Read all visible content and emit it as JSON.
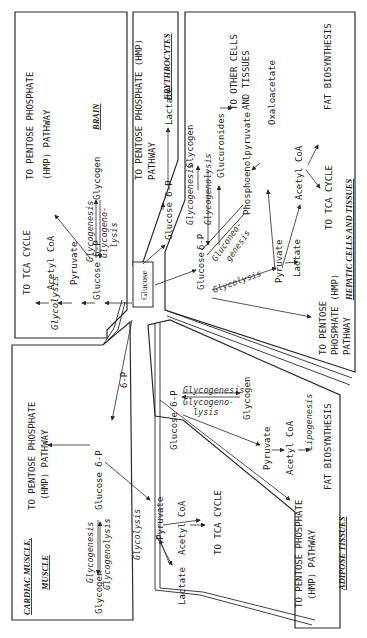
{
  "center": {
    "label": "Glucose"
  },
  "brain": {
    "title": "BRAIN",
    "glucose6p": "Glucose 6-P",
    "pyruvate": "Pyruvate",
    "acetylcoa": "Acetyl CoA",
    "tca": "TO TCA CYCLE",
    "glycolysis": "Glycolysis",
    "pentose_1": "TO PENTOSE PHOSPHATE",
    "pentose_2": "(HMP) PATHWAY",
    "glycogenesis": "Glycogenesis",
    "glycogen": "Glycogen",
    "glycogenolysis_1": "Glycogeno-",
    "glycogenolysis_2": "lysis"
  },
  "erythrocytes": {
    "title": "ERYTHROCYTES",
    "pentose_1": "TO PENTOSE PHOSPHATE (HMP)",
    "pentose_2": "PATHWAY",
    "glucose6p": "Glucose 6-P",
    "lactate": "Lactate"
  },
  "hepatic": {
    "title": "HEPATIC CELLS AND TISSUES",
    "glucose": "Glucose",
    "glucose6p": "6-P",
    "glycogenesis": "Glycogenesis",
    "glycogenolysis": "Glycogenolysis",
    "glycogen": "Glycogen",
    "glucuronides": "Glucuronides",
    "other_cells_1": "TO OTHER CELLS",
    "other_cells_2": "AND TISSUES",
    "gluconeo_1": "Gluconeo-",
    "gluconeo_2": "genesis",
    "pep": "Phosphoenolpyruvate",
    "oxaloacetate": "Oxaloacetate",
    "glycolysis": "Glycolysis",
    "pyruvate": "Pyruvate",
    "lactate": "Lactate",
    "acetylcoa": "Acetyl CoA",
    "fat": "FAT BIOSYNTHESIS",
    "tca": "TO TCA CYCLE",
    "pentose_1": "TO PENTOSE",
    "pentose_2": "PHOSPHATE (HMP)",
    "pentose_3": "PATHWAY"
  },
  "muscle": {
    "title_1": "CARDIAC MUSCLE,",
    "title_2": "MUSCLE",
    "glucose6p": "Glucose 6-P",
    "glucose6p_short": "6-P",
    "pentose_1": "TO PENTOSE PHOSPHATE",
    "pentose_2": "(HMP) PATHWAY",
    "glycogenesis": "Glycogenesis",
    "glycogenolysis": "Glycogenolysis",
    "glycogen": "Glycogen",
    "glycolysis": "Glycolysis",
    "pyruvate": "Pyruvate",
    "lactate": "Lactate",
    "acetylcoa": "Acetyl CoA",
    "tca": "TO TCA CYCLE"
  },
  "adipose": {
    "title": "ADIPOSE TISSUES",
    "glucose6p": "Glucose 6-P",
    "glycogenesis": "Glycogenesis",
    "glycogenolysis_1": "Glycogeno-",
    "glycogenolysis_2": "lysis",
    "glycogen": "Glycogen",
    "pyruvate": "Pyruvate",
    "acetylcoa": "Acetyl CoA",
    "lipogenesis": "Lipogenesis",
    "fat": "FAT BIOSYNTHESIS",
    "pentose_1": "TO PENTOSE PHOSPHATE",
    "pentose_2": "(HMP) PATHWAY"
  }
}
